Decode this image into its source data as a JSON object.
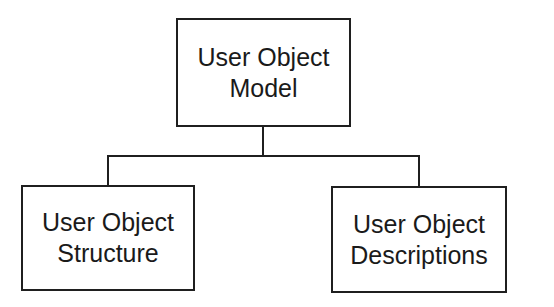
{
  "diagram": {
    "type": "hierarchy",
    "root": {
      "line1": "User Object",
      "line2": "Model"
    },
    "children": [
      {
        "line1": "User Object",
        "line2": "Structure"
      },
      {
        "line1": "User Object",
        "line2": "Descriptions"
      }
    ],
    "colors": {
      "stroke": "#1f1f1f",
      "background": "#ffffff",
      "text": "#1a1a1a"
    }
  }
}
